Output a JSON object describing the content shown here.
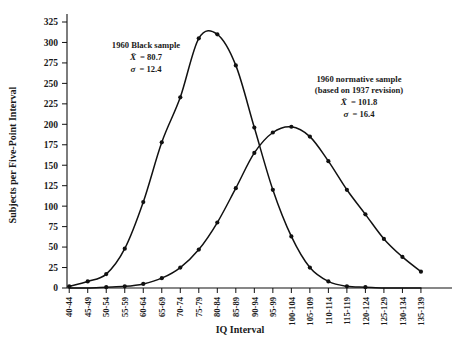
{
  "chart_data": {
    "type": "line",
    "title": "",
    "xlabel": "IQ Interval",
    "ylabel": "Subjects per Five-Point Interval",
    "ylim": [
      0,
      325
    ],
    "yticks": [
      0,
      25,
      50,
      75,
      100,
      125,
      150,
      175,
      200,
      225,
      250,
      275,
      300,
      325
    ],
    "grid": false,
    "legend_position": "inline-annotations",
    "categories": [
      "40-44",
      "45-49",
      "50-54",
      "55-59",
      "60-64",
      "65-69",
      "70-74",
      "75-79",
      "80-84",
      "85-89",
      "90-94",
      "95-99",
      "100-104",
      "105-109",
      "110-114",
      "115-119",
      "120-124",
      "125-129",
      "130-134",
      "135-139"
    ],
    "series": [
      {
        "name": "1960 Black sample",
        "values": [
          2,
          8,
          17,
          48,
          105,
          178,
          233,
          305,
          310,
          272,
          196,
          120,
          63,
          25,
          8,
          2,
          1,
          0,
          0,
          0
        ]
      },
      {
        "name": "1960 normative sample (based on 1937 revision)",
        "values": [
          0,
          0,
          1,
          2,
          5,
          12,
          25,
          47,
          80,
          122,
          165,
          190,
          197,
          185,
          155,
          120,
          90,
          60,
          38,
          20
        ]
      }
    ],
    "annotations": [
      {
        "id": "black-sample",
        "line1": "1960 Black sample",
        "line2_sym": "X",
        "line2_eq": "=  80.7",
        "line3_sym": "σ",
        "line3_eq": "=  12.4"
      },
      {
        "id": "normative-sample",
        "line1": "1960 normative sample",
        "line1b": "(based on 1937 revision)",
        "line2_sym": "X",
        "line2_eq": "=  101.8",
        "line3_sym": "σ",
        "line3_eq": "=  16.4"
      }
    ],
    "colors": {
      "curve": "#111111",
      "axis": "#111111",
      "text": "#1a1a1a",
      "background": "#ffffff"
    }
  }
}
